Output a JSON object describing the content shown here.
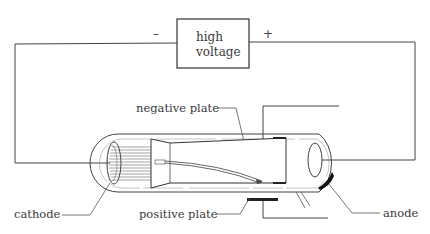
{
  "diagram": {
    "power_supply": {
      "label_line1": "high",
      "label_line2": "voltage",
      "negative_sign": "–",
      "positive_sign": "+"
    },
    "labels": {
      "negative_plate": "negative plate",
      "positive_plate": "positive plate",
      "cathode": "cathode",
      "anode": "anode"
    },
    "colors": {
      "line": "#444444",
      "text": "#3a3a3a",
      "plate": "#222222",
      "background": "#ffffff"
    }
  }
}
